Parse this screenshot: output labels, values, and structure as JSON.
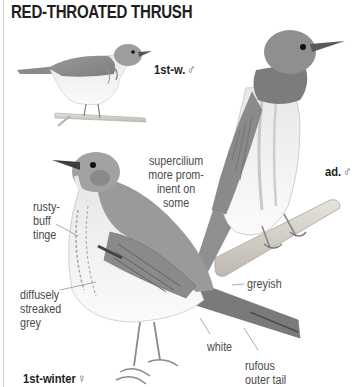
{
  "plate": {
    "title": "RED-THROATED THRUSH",
    "birds": [
      {
        "id": "first-winter-male",
        "age_label": "1st-w.",
        "sex_symbol": "♂"
      },
      {
        "id": "adult-male",
        "age_label": "ad.",
        "sex_symbol": "♂"
      },
      {
        "id": "first-winter-female",
        "age_label": "1st-winter",
        "sex_symbol": "♀"
      }
    ],
    "annotations": {
      "supercilium": [
        "supercilium",
        "more prom-",
        "inent on",
        "some"
      ],
      "rusty_buff": [
        "rusty-",
        "buff",
        "tinge"
      ],
      "diffusely_streaked": [
        "diffusely",
        "streaked",
        "grey"
      ],
      "greyish": "greyish",
      "white": "white",
      "rufous_tail": [
        "rufous",
        "outer tail"
      ]
    },
    "colors": {
      "text": "#1e1e1e",
      "label": "#4a4a4a",
      "plumage_grey": "#8e8e8e",
      "throat_grey": "#7a7a7a",
      "belly_white": "#f2f2f2",
      "branch": "#d9d6cf"
    }
  }
}
